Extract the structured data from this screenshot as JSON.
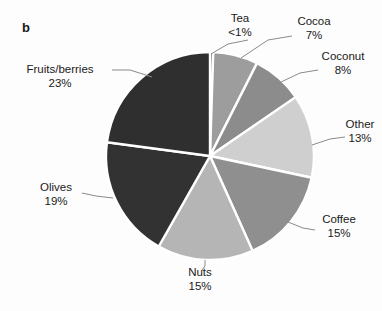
{
  "figure": {
    "panel_label": "b",
    "background_color": "#fdfdfd",
    "slice_border_color": "#ffffff",
    "leader_line_color": "#8a8a8a",
    "text_color": "#1a1a1a"
  },
  "chart_data": {
    "type": "pie",
    "title": "",
    "subtitle": "",
    "xlabel": "",
    "ylabel": "",
    "grid": false,
    "legend": "none",
    "label_style": "external labels with leader lines",
    "start_angle_deg": 0,
    "direction": "clockwise",
    "units": "percent",
    "categories": [
      "Tea",
      "Cocoa",
      "Coconut",
      "Other",
      "Coffee",
      "Nuts",
      "Olives",
      "Fruits/berries"
    ],
    "values": [
      0.5,
      7,
      8,
      13,
      15,
      15,
      19,
      23
    ],
    "value_labels": [
      "<1%",
      "7%",
      "8%",
      "13%",
      "15%",
      "15%",
      "19%",
      "23%"
    ],
    "colors": [
      "#4a4a4a",
      "#9d9d9d",
      "#8c8c8c",
      "#cfcfcf",
      "#8f8f8f",
      "#b5b5b5",
      "#323232",
      "#2f2f2f"
    ],
    "slices": [
      {
        "name": "Tea",
        "value_label": "<1%",
        "value": 0.5,
        "color": "#4a4a4a"
      },
      {
        "name": "Cocoa",
        "value_label": "7%",
        "value": 7,
        "color": "#9d9d9d"
      },
      {
        "name": "Coconut",
        "value_label": "8%",
        "value": 8,
        "color": "#8c8c8c"
      },
      {
        "name": "Other",
        "value_label": "13%",
        "value": 13,
        "color": "#cfcfcf"
      },
      {
        "name": "Coffee",
        "value_label": "15%",
        "value": 15,
        "color": "#8f8f8f"
      },
      {
        "name": "Nuts",
        "value_label": "15%",
        "value": 15,
        "color": "#b5b5b5"
      },
      {
        "name": "Olives",
        "value_label": "19%",
        "value": 19,
        "color": "#323232"
      },
      {
        "name": "Fruits/berries",
        "value_label": "23%",
        "value": 23,
        "color": "#2f2f2f"
      }
    ]
  }
}
